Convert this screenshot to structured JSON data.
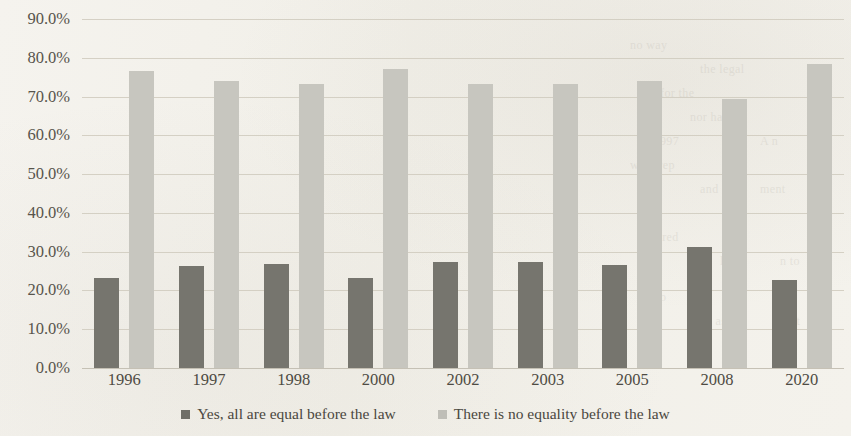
{
  "chart_data": {
    "type": "bar",
    "title": "",
    "subtitle": "",
    "xlabel": "",
    "ylabel": "",
    "categories": [
      "1996",
      "1997",
      "1998",
      "2000",
      "2002",
      "2003",
      "2005",
      "2008",
      "2020"
    ],
    "series": [
      {
        "name": "Yes, all are equal before the law",
        "color": "#76756e",
        "values": [
          23.3,
          26.2,
          26.8,
          23.2,
          27.3,
          27.4,
          26.6,
          31.2,
          22.6
        ]
      },
      {
        "name": "There is no equality before the law",
        "color": "#c7c6bf",
        "values": [
          76.7,
          74.0,
          73.3,
          77.0,
          73.3,
          73.2,
          74.0,
          69.5,
          78.3
        ]
      }
    ],
    "ylim": [
      0,
      90
    ],
    "ytick_labels": [
      "90.0%",
      "80.0%",
      "70.0%",
      "60.0%",
      "50.0%",
      "40.0%",
      "30.0%",
      "20.0%",
      "10.0%",
      "0.0%"
    ],
    "ytick_values": [
      90,
      80,
      70,
      60,
      50,
      40,
      30,
      20,
      10,
      0
    ],
    "grid": true,
    "legend_position": "bottom"
  },
  "legend": {
    "items": [
      {
        "label": "Yes, all are equal before the law",
        "marker": "square-swatch"
      },
      {
        "label": "There is no equality before the law",
        "marker": "square-swatch"
      }
    ]
  },
  "background_text": {
    "lines": [
      "no way",
      "the legal",
      "for the",
      "nor had",
      "in 1997",
      "A n",
      "were rep",
      "and",
      "ment",
      "pared",
      "l ou",
      "n to",
      "ty do",
      "ed as",
      "ot"
    ]
  }
}
